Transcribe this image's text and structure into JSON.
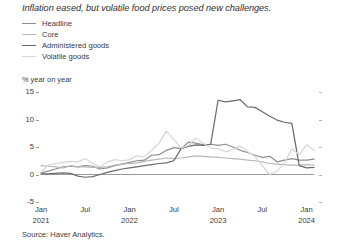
{
  "title": "Inflation eased, but volatile food prices posed new challenges.",
  "source": "Source: Haver Analytics.",
  "yunit": "% year on year",
  "colors": {
    "headline": "#8f8f8f",
    "core": "#b8b8b8",
    "administered": "#6b6b6b",
    "volatile": "#d6d6d6",
    "axis": "#9a9a9a",
    "text": "#3a3a3a"
  },
  "legend": {
    "position": "top-left",
    "items": [
      {
        "label": "Headline",
        "color": "#8f8f8f"
      },
      {
        "label": "Core",
        "color": "#b8b8b8"
      },
      {
        "label": "Administered goods",
        "color": "#6b6b6b"
      },
      {
        "label": "Volatile goods",
        "color": "#d6d6d6"
      }
    ]
  },
  "axis": {
    "y_ticks": [
      "15",
      "10",
      "5",
      "0",
      "-5"
    ],
    "x_months": [
      "Jan",
      "Jul",
      "Jan",
      "Jul",
      "Jan",
      "Jul",
      "Jan"
    ],
    "x_years": [
      "2021",
      "",
      "2022",
      "",
      "2023",
      "",
      "2024"
    ]
  },
  "chart_data": {
    "type": "line",
    "title": "Inflation eased, but volatile food prices posed new challenges.",
    "xlabel": "",
    "ylabel": "% year on year",
    "ylim": [
      -5,
      15
    ],
    "yticks": [
      -5,
      0,
      5,
      10,
      15
    ],
    "grid": false,
    "legend_position": "top-left",
    "x": [
      "2021-01",
      "2021-02",
      "2021-03",
      "2021-04",
      "2021-05",
      "2021-06",
      "2021-07",
      "2021-08",
      "2021-09",
      "2021-10",
      "2021-11",
      "2021-12",
      "2022-01",
      "2022-02",
      "2022-03",
      "2022-04",
      "2022-05",
      "2022-06",
      "2022-07",
      "2022-08",
      "2022-09",
      "2022-10",
      "2022-11",
      "2022-12",
      "2023-01",
      "2023-02",
      "2023-03",
      "2023-04",
      "2023-05",
      "2023-06",
      "2023-07",
      "2023-08",
      "2023-09",
      "2023-10",
      "2023-11",
      "2023-12",
      "2024-01",
      "2024-02"
    ],
    "x_tick_labels": [
      "Jan 2021",
      "Jul",
      "Jan 2022",
      "Jul",
      "Jan 2023",
      "Jul",
      "Jan 2024"
    ],
    "x_tick_positions": [
      "2021-01",
      "2021-07",
      "2022-01",
      "2022-07",
      "2023-01",
      "2023-07",
      "2024-01"
    ],
    "series": [
      {
        "name": "Headline",
        "color": "#8f8f8f",
        "values": [
          0.3,
          0.6,
          1.0,
          1.4,
          1.5,
          1.4,
          1.6,
          1.5,
          1.0,
          1.2,
          1.6,
          1.9,
          2.2,
          2.5,
          2.6,
          3.5,
          3.6,
          4.4,
          4.9,
          4.7,
          5.9,
          5.7,
          5.4,
          5.5,
          5.3,
          5.5,
          5.0,
          4.4,
          4.0,
          3.5,
          3.1,
          3.3,
          2.3,
          2.6,
          2.9,
          2.6,
          2.6,
          2.8
        ]
      },
      {
        "name": "Core",
        "color": "#b8b8b8",
        "values": [
          1.6,
          1.5,
          1.4,
          1.2,
          1.6,
          1.4,
          1.4,
          1.3,
          1.3,
          1.4,
          1.7,
          1.9,
          2.0,
          2.1,
          2.4,
          2.6,
          2.8,
          3.0,
          2.9,
          3.0,
          3.2,
          3.4,
          3.3,
          3.2,
          3.1,
          3.0,
          2.9,
          2.8,
          2.6,
          2.5,
          2.3,
          2.0,
          1.9,
          1.8,
          1.7,
          1.7,
          1.8,
          1.7
        ]
      },
      {
        "name": "Administered goods",
        "color": "#6b6b6b",
        "values": [
          0.1,
          0.1,
          0.2,
          0.3,
          0.2,
          -0.3,
          -0.5,
          -0.4,
          0.0,
          0.4,
          0.7,
          1.0,
          1.2,
          1.4,
          1.6,
          1.8,
          2.0,
          2.1,
          2.5,
          4.7,
          5.1,
          5.4,
          5.3,
          5.5,
          13.5,
          13.2,
          13.4,
          13.6,
          12.3,
          12.2,
          11.4,
          10.6,
          9.9,
          9.5,
          9.3,
          1.6,
          1.2,
          1.3
        ]
      },
      {
        "name": "Volatile goods",
        "color": "#d6d6d6",
        "values": [
          0.4,
          1.7,
          2.0,
          2.2,
          2.4,
          2.3,
          2.9,
          2.0,
          1.4,
          2.3,
          2.7,
          2.5,
          2.7,
          3.4,
          3.2,
          4.4,
          5.7,
          7.9,
          6.4,
          4.8,
          5.3,
          6.6,
          5.7,
          4.8,
          4.7,
          4.1,
          4.5,
          5.2,
          4.2,
          3.3,
          1.6,
          0.0,
          0.6,
          2.1,
          4.7,
          3.6,
          5.4,
          4.4
        ]
      }
    ]
  }
}
